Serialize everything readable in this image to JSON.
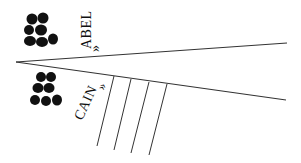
{
  "diagram": {
    "labels": {
      "upper": "ABEL",
      "lower": "CAIN",
      "upper_marker": "»",
      "lower_marker": "»"
    },
    "icons": {
      "upper": "stone-pile-icon",
      "lower": "stone-pile-icon"
    },
    "colors": {
      "ink": "#111111",
      "line": "#333333",
      "background": "#ffffff"
    },
    "geometry": {
      "vertex": [
        16,
        62
      ],
      "upper_line_end": [
        287,
        43
      ],
      "lower_line_end": [
        286,
        100
      ],
      "hatch_lines": [
        {
          "top": [
            114,
            76
          ],
          "bottom": [
            97,
            146
          ]
        },
        {
          "top": [
            131,
            79
          ],
          "bottom": [
            114,
            150
          ]
        },
        {
          "top": [
            149,
            82
          ],
          "bottom": [
            131,
            153
          ]
        },
        {
          "top": [
            167,
            84
          ],
          "bottom": [
            149,
            155
          ]
        }
      ]
    }
  }
}
